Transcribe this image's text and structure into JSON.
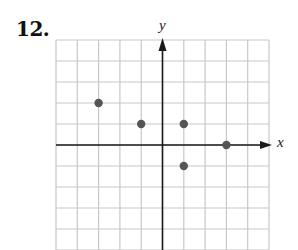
{
  "problem": {
    "number": "12."
  },
  "chart_data": {
    "type": "scatter",
    "title": "",
    "xlabel": "x",
    "ylabel": "y",
    "xlim": [
      -5,
      5
    ],
    "ylim": [
      -5,
      5
    ],
    "grid": true,
    "tick_labels": false,
    "points": [
      {
        "x": -3,
        "y": 2
      },
      {
        "x": -1,
        "y": 1
      },
      {
        "x": 1,
        "y": 1
      },
      {
        "x": 3,
        "y": 0
      },
      {
        "x": 1,
        "y": -1
      }
    ],
    "colors": {
      "grid": "#c8c8c8",
      "axes": "#1a1a1a",
      "points": "#555555",
      "background": "#ffffff"
    }
  }
}
